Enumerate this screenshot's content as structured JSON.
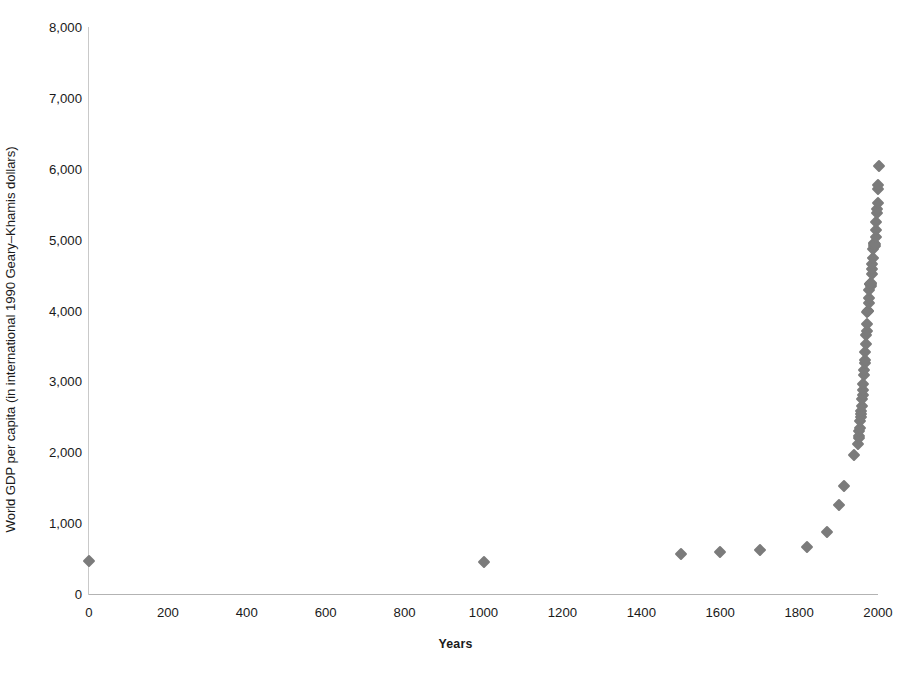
{
  "chart_data": {
    "type": "scatter",
    "title": "",
    "xlabel": "Years",
    "ylabel": "World GDP per capita (in international 1990 Geary–Khamis dollars)",
    "xlim": [
      0,
      2000
    ],
    "ylim": [
      0,
      8000
    ],
    "grid": false,
    "legend": "none",
    "marker": "diamond",
    "marker_color": "#7b7b7b",
    "x_ticks": [
      0,
      200,
      400,
      600,
      800,
      1000,
      1200,
      1400,
      1600,
      1800,
      2000
    ],
    "x_tick_labels": [
      "0",
      "200",
      "400",
      "600",
      "800",
      "1000",
      "1200",
      "1400",
      "1600",
      "1800",
      "2000"
    ],
    "y_ticks": [
      0,
      1000,
      2000,
      3000,
      4000,
      5000,
      6000,
      7000,
      8000
    ],
    "y_tick_labels": [
      "0",
      "1,000",
      "2,000",
      "3,000",
      "4,000",
      "5,000",
      "6,000",
      "7,000",
      "8,000"
    ],
    "series": [
      {
        "name": "World GDP per capita",
        "points": [
          [
            1,
            467
          ],
          [
            1000,
            453
          ],
          [
            1500,
            566
          ],
          [
            1600,
            596
          ],
          [
            1700,
            616
          ],
          [
            1820,
            666
          ],
          [
            1870,
            870
          ],
          [
            1900,
            1262
          ],
          [
            1913,
            1524
          ],
          [
            1940,
            1958
          ],
          [
            1950,
            2111
          ],
          [
            1951,
            2195
          ],
          [
            1952,
            2236
          ],
          [
            1953,
            2305
          ],
          [
            1954,
            2345
          ],
          [
            1955,
            2434
          ],
          [
            1956,
            2492
          ],
          [
            1957,
            2541
          ],
          [
            1958,
            2577
          ],
          [
            1959,
            2650
          ],
          [
            1960,
            2758
          ],
          [
            1961,
            2808
          ],
          [
            1962,
            2885
          ],
          [
            1963,
            2960
          ],
          [
            1964,
            3084
          ],
          [
            1965,
            3167
          ],
          [
            1966,
            3254
          ],
          [
            1967,
            3306
          ],
          [
            1968,
            3414
          ],
          [
            1969,
            3525
          ],
          [
            1970,
            3648
          ],
          [
            1971,
            3714
          ],
          [
            1972,
            3812
          ],
          [
            1973,
            3973
          ],
          [
            1974,
            3994
          ],
          [
            1975,
            3992
          ],
          [
            1976,
            4100
          ],
          [
            1977,
            4177
          ],
          [
            1978,
            4291
          ],
          [
            1979,
            4371
          ],
          [
            1980,
            4378
          ],
          [
            1981,
            4380
          ],
          [
            1982,
            4345
          ],
          [
            1983,
            4382
          ],
          [
            1984,
            4510
          ],
          [
            1985,
            4584
          ],
          [
            1986,
            4650
          ],
          [
            1987,
            4736
          ],
          [
            1988,
            4866
          ],
          [
            1989,
            4942
          ],
          [
            1990,
            4958
          ],
          [
            1991,
            4913
          ],
          [
            1992,
            4913
          ],
          [
            1993,
            4933
          ],
          [
            1994,
            5030
          ],
          [
            1995,
            5131
          ],
          [
            1996,
            5248
          ],
          [
            1997,
            5375
          ],
          [
            1998,
            5426
          ],
          [
            1999,
            5514
          ],
          [
            2000,
            5709
          ],
          [
            2001,
            5768
          ],
          [
            2003,
            6038
          ]
        ]
      }
    ]
  },
  "axes": {
    "y_title": "World GDP per capita (in international 1990 Geary–Khamis dollars)",
    "x_title": "Years"
  }
}
